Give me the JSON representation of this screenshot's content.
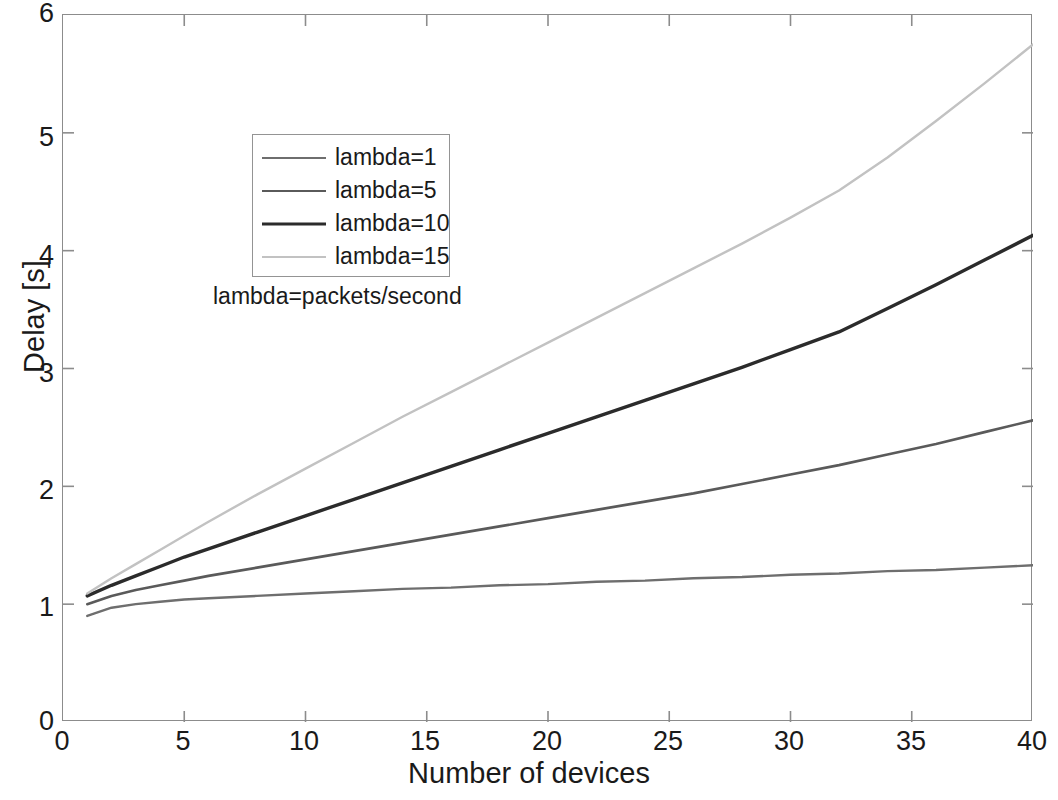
{
  "chart_data": {
    "type": "line",
    "title": "",
    "xlabel": "Number of devices",
    "ylabel": "Delay [s]",
    "xlim": [
      0,
      40
    ],
    "ylim": [
      0,
      6
    ],
    "xticks": [
      "0",
      "5",
      "10",
      "15",
      "20",
      "25",
      "30",
      "35",
      "40"
    ],
    "yticks": [
      "0",
      "1",
      "2",
      "3",
      "4",
      "5",
      "6"
    ],
    "grid": false,
    "legend_position": "upper-left-inside",
    "legend_caption": "lambda=packets/second",
    "x": [
      1,
      2,
      3,
      4,
      5,
      6,
      8,
      10,
      12,
      14,
      16,
      18,
      20,
      22,
      24,
      26,
      28,
      30,
      32,
      34,
      36,
      38,
      40
    ],
    "series": [
      {
        "name": "lambda=1",
        "label": "lambda=1",
        "color": "#6e6e6e",
        "width": 2.4,
        "values": [
          0.9,
          0.97,
          1.0,
          1.02,
          1.04,
          1.05,
          1.07,
          1.09,
          1.11,
          1.13,
          1.14,
          1.16,
          1.17,
          1.19,
          1.2,
          1.22,
          1.23,
          1.25,
          1.26,
          1.28,
          1.29,
          1.31,
          1.33
        ]
      },
      {
        "name": "lambda=5",
        "label": "lambda=5",
        "color": "#5a5a5a",
        "width": 2.6,
        "values": [
          1.0,
          1.07,
          1.12,
          1.16,
          1.2,
          1.24,
          1.31,
          1.38,
          1.45,
          1.52,
          1.59,
          1.66,
          1.73,
          1.8,
          1.87,
          1.94,
          2.02,
          2.1,
          2.18,
          2.27,
          2.36,
          2.46,
          2.56
        ]
      },
      {
        "name": "lambda=10",
        "label": "lambda=10",
        "color": "#2b2b2b",
        "width": 3.4,
        "values": [
          1.07,
          1.16,
          1.24,
          1.32,
          1.4,
          1.47,
          1.61,
          1.75,
          1.89,
          2.03,
          2.17,
          2.31,
          2.45,
          2.59,
          2.73,
          2.87,
          3.01,
          3.16,
          3.31,
          3.51,
          3.71,
          3.92,
          4.13
        ]
      },
      {
        "name": "lambda=15",
        "label": "lambda=15",
        "color": "#c2c2c2",
        "width": 2.4,
        "values": [
          1.09,
          1.22,
          1.34,
          1.46,
          1.58,
          1.7,
          1.93,
          2.15,
          2.37,
          2.59,
          2.8,
          3.01,
          3.22,
          3.43,
          3.64,
          3.85,
          4.06,
          4.28,
          4.51,
          4.79,
          5.1,
          5.42,
          5.75
        ]
      }
    ]
  },
  "axes": {
    "frame_color": "#8c8c8c",
    "tick_color": "#8c8c8c",
    "text_color": "#1a1a1a"
  }
}
